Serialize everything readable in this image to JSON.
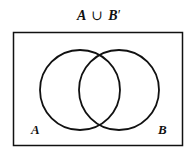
{
  "title": "A ∪ B′",
  "title_parts": {
    "a": "A",
    "op": "∪",
    "b": "B",
    "prime": "′"
  },
  "diagram": {
    "type": "venn",
    "universe": {
      "x": 13,
      "y": 32,
      "w": 170,
      "h": 114
    },
    "sets": [
      {
        "name": "A",
        "label": "A",
        "cx": 80,
        "cy": 90,
        "r": 40
      },
      {
        "name": "B",
        "label": "B",
        "cx": 119,
        "cy": 90,
        "r": 40
      }
    ],
    "stroke_color": "#111111"
  }
}
